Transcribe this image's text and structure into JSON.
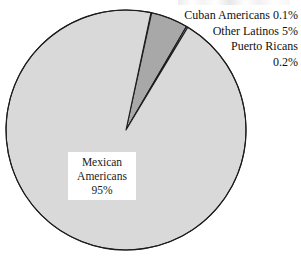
{
  "chart_data": {
    "type": "pie",
    "title": "",
    "subtitle": "",
    "xlabel": "",
    "ylabel": "",
    "legend_position": "callout-labels-top-right",
    "grid": false,
    "units": "percent",
    "categories": [
      "Mexican Americans",
      "Other Latinos",
      "Puerto Ricans",
      "Cuban Americans"
    ],
    "values": [
      95,
      5,
      0.2,
      0.1
    ],
    "slices": [
      {
        "label": "Mexican Americans",
        "value": 95,
        "value_text": "95%",
        "color": "#d9d9d9",
        "label_placement": "inside-white-box"
      },
      {
        "label": "Other Latinos",
        "value": 5,
        "value_text": "5%",
        "color": "#a8a8a8",
        "label_placement": "callout-right"
      },
      {
        "label": "Puerto Ricans",
        "value": 0.2,
        "value_text": "0.2%",
        "color": "#d9d9d9",
        "label_placement": "callout-right"
      },
      {
        "label": "Cuban Americans",
        "value": 0.1,
        "value_text": "0.1%",
        "color": "#d9d9d9",
        "label_placement": "callout-right"
      }
    ]
  },
  "center_label": {
    "line1": "Mexican",
    "line2": "Americans",
    "line3": "95%"
  },
  "callouts": [
    {
      "text": "Cuban Americans 0.1%"
    },
    {
      "text": "Other Latinos 5%"
    },
    {
      "text": "Puerto Ricans"
    },
    {
      "text": "0.2%"
    }
  ],
  "colors": {
    "slice_major": "#d9d9d9",
    "slice_other_latinos": "#a8a8a8",
    "outline": "#1c1c1c",
    "background": "#ffffff",
    "text": "#111111"
  },
  "geometry": {
    "center_x": 126,
    "center_y": 130,
    "radius": 120
  }
}
